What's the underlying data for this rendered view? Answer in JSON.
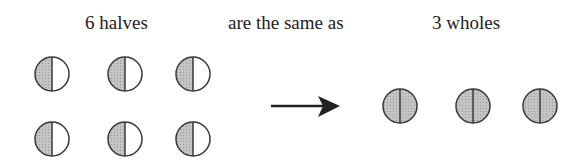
{
  "labels": {
    "left": "6 halves",
    "middle": "are the same as",
    "right": "3 wholes"
  },
  "halves": {
    "count": 6,
    "fill_color": "#b8b8b8",
    "stroke_color": "#3a3a3a"
  },
  "wholes": {
    "count": 3,
    "fill_color": "#b8b8b8",
    "stroke_color": "#3a3a3a"
  },
  "arrow": {
    "direction": "right",
    "color": "#222222"
  }
}
